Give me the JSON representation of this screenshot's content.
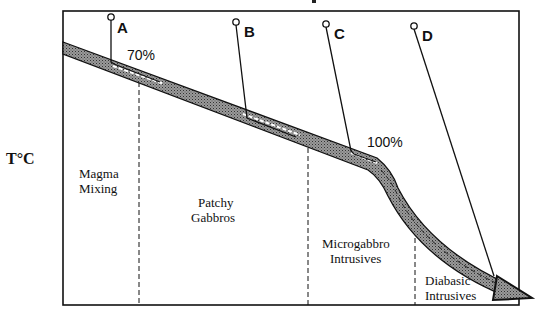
{
  "diagram": {
    "y_axis_label": "T°C",
    "points": [
      {
        "id": "A",
        "label": "A"
      },
      {
        "id": "B",
        "label": "B"
      },
      {
        "id": "C",
        "label": "C"
      },
      {
        "id": "D",
        "label": "D"
      }
    ],
    "percent_labels": [
      {
        "label": "70%"
      },
      {
        "label": "100%"
      }
    ],
    "zones": [
      {
        "line1": "Magma",
        "line2": "Mixing"
      },
      {
        "line1": "Patchy",
        "line2": "Gabbros"
      },
      {
        "line1": "Microgabbro",
        "line2": "Intrusives"
      },
      {
        "line1": "Diabasic",
        "line2": "Intrusives"
      }
    ],
    "colors": {
      "stroke": "#111111",
      "band_fill": "#8a8a8a",
      "background": "#ffffff"
    }
  }
}
